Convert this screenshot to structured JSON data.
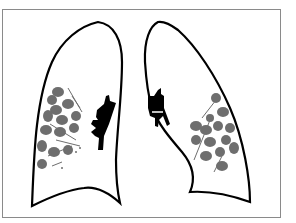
{
  "figure": {
    "colors": {
      "background": "#ffffff",
      "frame": "#8a8a8a",
      "outline": "#000000",
      "hilum": "#000000",
      "opacity": "#6e6e6e"
    },
    "left_side_label": "",
    "right_side_label": ""
  }
}
